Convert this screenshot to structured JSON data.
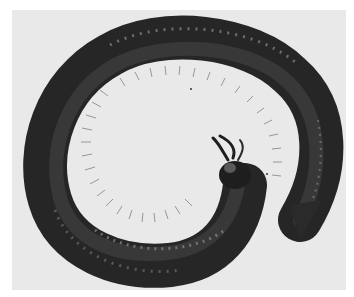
{
  "image": {
    "subject": "coiled millipede",
    "style": "grayscale photograph",
    "colors": {
      "border": "#ffffff",
      "background": "#e9e9e9",
      "body_dark": "#1e1e1e",
      "body_mid": "#3a3a3a",
      "segment_highlight": "#8a8a8a",
      "legs": "#7a7a7a"
    }
  }
}
